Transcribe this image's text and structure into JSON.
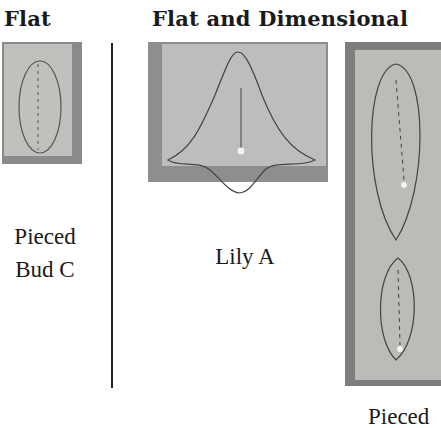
{
  "headings": {
    "flat": "Flat",
    "flat_dimensional": "Flat and Dimensional"
  },
  "captions": {
    "pieced_bud_c_line1": "Pieced",
    "pieced_bud_c_line2": "Bud C",
    "lily_a": "Lily A",
    "pieced_partial": "Pieced"
  },
  "colors": {
    "fabric_light": "#c4c4c2",
    "fabric_dark": "#7d7d7d",
    "outline": "#444444",
    "text": "#1a1a1a"
  }
}
